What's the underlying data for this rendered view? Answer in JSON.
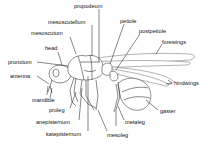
{
  "diagram": {
    "labels": {
      "propodeum": "propodeum",
      "mesoscutellum": "mesoscutellum",
      "mesoscutum": "mesoscutum",
      "petiole": "petiole",
      "postpetiole": "postpetiole",
      "forewings": "forewings",
      "head": "head",
      "pronotum": "pronotum",
      "antenna": "antenna",
      "hindwings": "hindwings",
      "mandible": "mandible",
      "proleg": "proleg",
      "gaster": "gaster",
      "anepisternum": "anepisternum",
      "metaleg": "metaleg",
      "katepisternum": "katepisternum",
      "mesoleg": "mesoleg"
    },
    "colors": {
      "line": "#222222",
      "background": "#ffffff",
      "text": "#111111"
    }
  }
}
